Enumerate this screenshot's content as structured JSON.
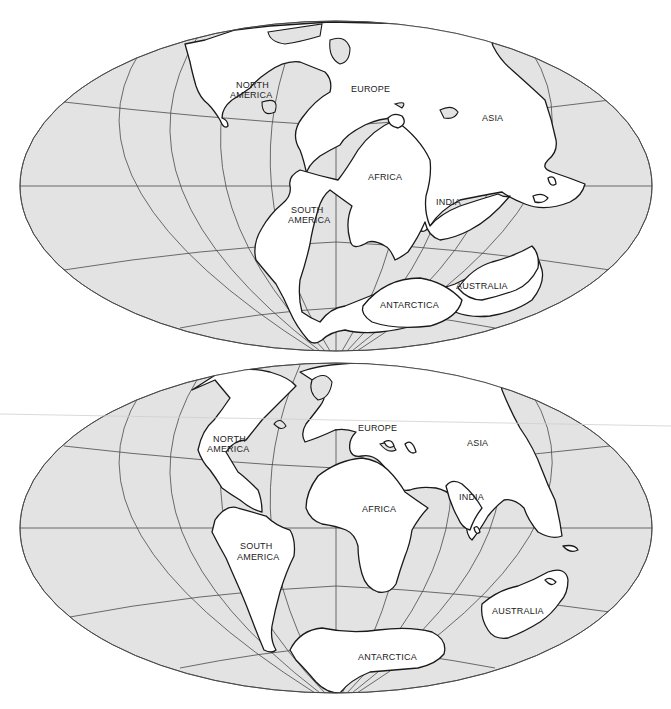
{
  "figure": {
    "style": {
      "ocean_color": "#e3e3e3",
      "land_color": "#ffffff",
      "line_color": "#1a1a1a",
      "grid_color": "#4a4a4a"
    },
    "maps": [
      {
        "id": "top",
        "projection": "mollweide-like oval",
        "labels": {
          "north_america": [
            "NORTH",
            "AMERICA"
          ],
          "south_america": [
            "SOUTH",
            "AMERICA"
          ],
          "europe": "EUROPE",
          "asia": "ASIA",
          "africa": "AFRICA",
          "india": "INDIA",
          "antarctica": "ANTARCTICA",
          "australia": "AUSTRALIA"
        }
      },
      {
        "id": "bottom",
        "projection": "mollweide-like oval",
        "labels": {
          "north_america": [
            "NORTH",
            "AMERICA"
          ],
          "south_america": [
            "SOUTH",
            "AMERICA"
          ],
          "europe": "EUROPE",
          "asia": "ASIA",
          "africa": "AFRICA",
          "india": "INDIA",
          "antarctica": "ANTARCTICA",
          "australia": "AUSTRALIA"
        }
      }
    ]
  }
}
